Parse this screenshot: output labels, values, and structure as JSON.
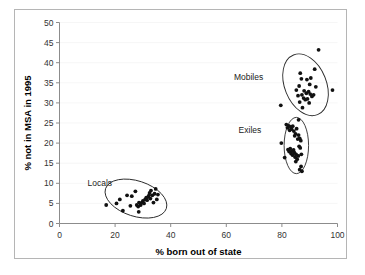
{
  "chart_data": {
    "type": "scatter",
    "title": "",
    "xlabel": "% born out of state",
    "ylabel": "% not in MSA in 1995",
    "xlim": [
      0,
      100
    ],
    "ylim": [
      0,
      50
    ],
    "xticks": [
      0,
      20,
      40,
      60,
      80,
      100
    ],
    "yticks": [
      0,
      5,
      10,
      15,
      20,
      25,
      30,
      35,
      40,
      45,
      50
    ],
    "grid": false,
    "legend": "annotations-on-plot",
    "annotations": [
      {
        "text": "Locals",
        "x": 14.5,
        "y": 9.3
      },
      {
        "text": "Exiles",
        "x": 68.5,
        "y": 22.6
      },
      {
        "text": "Mobiles",
        "x": 68.0,
        "y": 35.6
      }
    ],
    "series": [
      {
        "name": "Locals",
        "marker": "filled-circle",
        "color": "#111111",
        "ellipse": {
          "cx": 27.5,
          "cy": 6.2,
          "rx": 11.5,
          "ry": 4.4,
          "rotation": -18
        },
        "points": [
          [
            16.8,
            4.6
          ],
          [
            20.5,
            5.0
          ],
          [
            21.7,
            6.0
          ],
          [
            22.8,
            3.2
          ],
          [
            24.3,
            7.0
          ],
          [
            25.5,
            4.4
          ],
          [
            27.3,
            8.0
          ],
          [
            27.8,
            4.6
          ],
          [
            28.3,
            4.2
          ],
          [
            28.6,
            5.2
          ],
          [
            29.2,
            4.6
          ],
          [
            29.6,
            5.2
          ],
          [
            30.0,
            5.6
          ],
          [
            30.4,
            5.0
          ],
          [
            30.8,
            6.0
          ],
          [
            31.2,
            6.4
          ],
          [
            31.5,
            5.8
          ],
          [
            31.9,
            6.6
          ],
          [
            32.2,
            7.0
          ],
          [
            32.4,
            7.6
          ],
          [
            32.7,
            6.2
          ],
          [
            32.9,
            8.2
          ],
          [
            33.4,
            7.0
          ],
          [
            33.8,
            5.2
          ],
          [
            34.2,
            7.4
          ],
          [
            34.6,
            8.6
          ],
          [
            35.0,
            6.0
          ],
          [
            28.5,
            2.9
          ],
          [
            26.0,
            6.8
          ],
          [
            35.4,
            7.2
          ]
        ]
      },
      {
        "name": "Exiles",
        "marker": "filled-circle",
        "color": "#111111",
        "ellipse": {
          "cx": 85.2,
          "cy": 19.4,
          "rx": 4.4,
          "ry": 7.0,
          "rotation": 0
        },
        "points": [
          [
            79.8,
            20.0
          ],
          [
            81.6,
            24.6
          ],
          [
            82.0,
            23.8
          ],
          [
            82.5,
            24.3
          ],
          [
            82.8,
            23.2
          ],
          [
            83.2,
            24.0
          ],
          [
            83.5,
            23.5
          ],
          [
            83.9,
            24.2
          ],
          [
            84.3,
            23.0
          ],
          [
            84.6,
            21.8
          ],
          [
            84.9,
            22.3
          ],
          [
            85.3,
            23.6
          ],
          [
            85.7,
            21.0
          ],
          [
            86.0,
            22.0
          ],
          [
            86.4,
            21.2
          ],
          [
            86.8,
            20.6
          ],
          [
            82.2,
            18.4
          ],
          [
            82.6,
            17.9
          ],
          [
            83.0,
            18.6
          ],
          [
            83.3,
            17.4
          ],
          [
            83.6,
            18.0
          ],
          [
            83.9,
            17.0
          ],
          [
            84.2,
            18.3
          ],
          [
            84.5,
            17.6
          ],
          [
            84.8,
            16.5
          ],
          [
            85.1,
            17.2
          ],
          [
            85.5,
            16.0
          ],
          [
            85.9,
            16.8
          ],
          [
            86.2,
            19.2
          ],
          [
            86.6,
            18.8
          ],
          [
            87.0,
            17.2
          ],
          [
            86.9,
            14.2
          ],
          [
            86.4,
            13.4
          ],
          [
            87.2,
            13.0
          ],
          [
            85.0,
            15.4
          ],
          [
            81.0,
            16.4
          ],
          [
            86.0,
            25.8
          ]
        ]
      },
      {
        "name": "Mobiles",
        "marker": "filled-circle",
        "color": "#111111",
        "ellipse": {
          "cx": 88.5,
          "cy": 34.5,
          "rx": 7.5,
          "ry": 8.0,
          "rotation": 22
        },
        "points": [
          [
            79.6,
            29.4
          ],
          [
            93.2,
            43.2
          ],
          [
            86.6,
            37.4
          ],
          [
            91.8,
            38.4
          ],
          [
            87.0,
            36.0
          ],
          [
            89.0,
            35.8
          ],
          [
            86.2,
            34.2
          ],
          [
            90.4,
            36.2
          ],
          [
            87.2,
            32.0
          ],
          [
            88.0,
            33.0
          ],
          [
            88.8,
            32.4
          ],
          [
            89.6,
            32.8
          ],
          [
            90.2,
            32.2
          ],
          [
            90.8,
            31.6
          ],
          [
            91.4,
            32.0
          ],
          [
            87.8,
            31.2
          ],
          [
            88.4,
            30.8
          ],
          [
            89.2,
            31.0
          ],
          [
            85.8,
            31.8
          ],
          [
            86.4,
            30.2
          ],
          [
            87.4,
            28.8
          ],
          [
            98.2,
            33.2
          ],
          [
            92.2,
            34.0
          ],
          [
            89.8,
            30.0
          ],
          [
            85.2,
            33.2
          ],
          [
            90.0,
            34.6
          ]
        ]
      }
    ]
  },
  "axis": {
    "x_title": "% born out of state",
    "y_title": "% not in MSA in 1995",
    "x_tick_labels": [
      "0",
      "20",
      "40",
      "60",
      "80",
      "100"
    ],
    "y_tick_labels": [
      "0",
      "5",
      "10",
      "15",
      "20",
      "25",
      "30",
      "35",
      "40",
      "45",
      "50"
    ]
  },
  "colors": {
    "marker": "#111111",
    "ellipse": "#2a2a2a",
    "axis": "#8c8c8c",
    "frame": "#b5b5b5",
    "background": "#ffffff"
  }
}
